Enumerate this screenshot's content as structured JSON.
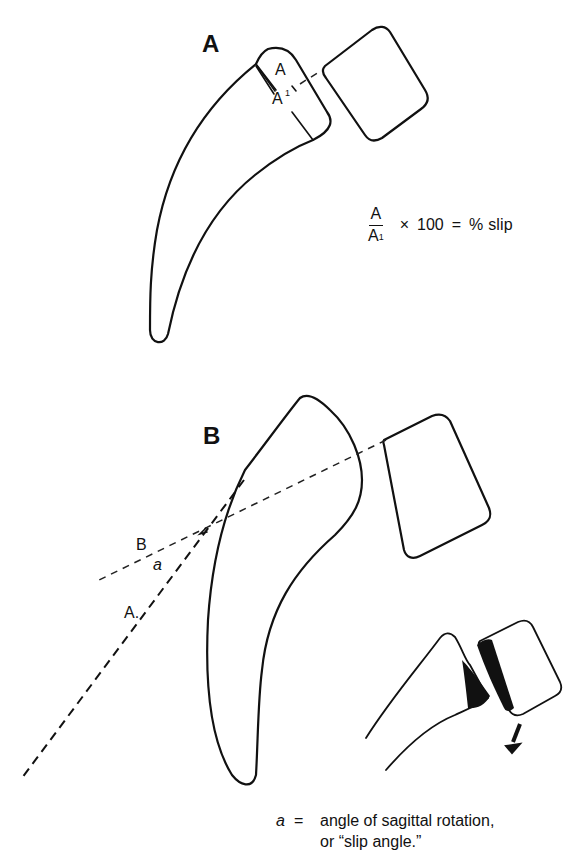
{
  "figure": {
    "panels": [
      {
        "id": "A",
        "label": "A",
        "measure_labels": {
          "a": "A",
          "a_prime": "A",
          "a_prime_superscript": "1"
        },
        "formula": {
          "numerator": "A",
          "denominator": "A",
          "denominator_superscript": "1",
          "times": "×",
          "factor": "100",
          "equals": "=",
          "result": "% slip"
        }
      },
      {
        "id": "B",
        "label": "B",
        "line_labels": {
          "line_b": "B",
          "angle": "a",
          "line_a": "A."
        },
        "legend": {
          "symbol": "a",
          "equals": "=",
          "line1": "angle of sagittal rotation,",
          "line2": "or “slip angle.”"
        },
        "inset": {
          "description": "forward slip with rotation arrow",
          "arrow_icon": "arrow-down-left-icon"
        }
      }
    ],
    "colors": {
      "ink": "#111111",
      "background": "#ffffff"
    }
  }
}
